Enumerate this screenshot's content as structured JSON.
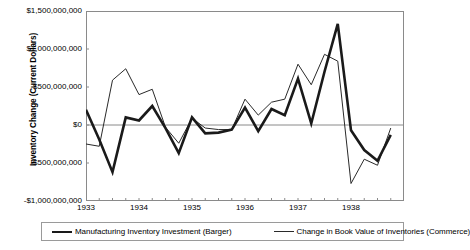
{
  "chart_data": {
    "type": "line",
    "title": "",
    "xlabel": "",
    "ylabel": "Inventory Change (Current Dollars)",
    "ylim": [
      -1000000000,
      1500000000
    ],
    "ytick_values": [
      1500000000,
      1000000000,
      500000000,
      0,
      -500000000,
      -1000000000
    ],
    "ytick_labels": [
      "$1,500,000,000",
      "$1,000,000,000",
      "$500,000,000",
      "$0",
      "-$500,000,000",
      "-$1,000,000,000"
    ],
    "xtick_labels": [
      "1933",
      "1934",
      "1935",
      "1936",
      "1937",
      "1938"
    ],
    "x_period": "quarterly",
    "x": [
      "1933Q1",
      "1933Q2",
      "1933Q3",
      "1933Q4",
      "1934Q1",
      "1934Q2",
      "1934Q3",
      "1934Q4",
      "1935Q1",
      "1935Q2",
      "1935Q3",
      "1935Q4",
      "1936Q1",
      "1936Q2",
      "1936Q3",
      "1936Q4",
      "1937Q1",
      "1937Q2",
      "1937Q3",
      "1937Q4",
      "1938Q1",
      "1938Q2",
      "1938Q3",
      "1938Q4"
    ],
    "grid": false,
    "legend_position": "bottom",
    "zero_line": true,
    "series": [
      {
        "name": "Manufacturing Inventory Investment (Barger)",
        "style": "thick",
        "color": "#1a1a1a",
        "values": [
          200000000,
          -190000000,
          -620000000,
          100000000,
          60000000,
          250000000,
          -40000000,
          -370000000,
          100000000,
          -110000000,
          -100000000,
          -60000000,
          230000000,
          -80000000,
          210000000,
          130000000,
          610000000,
          20000000,
          700000000,
          1330000000,
          -70000000,
          -330000000,
          -470000000,
          -130000000
        ]
      },
      {
        "name": "Change in Book Value of Inventories (Commerce)",
        "style": "thin",
        "color": "#2a2a2a",
        "values": [
          -250000000,
          -280000000,
          590000000,
          740000000,
          400000000,
          470000000,
          -30000000,
          -240000000,
          90000000,
          -40000000,
          -60000000,
          -60000000,
          340000000,
          130000000,
          300000000,
          340000000,
          800000000,
          530000000,
          930000000,
          840000000,
          -770000000,
          -450000000,
          -530000000,
          -40000000
        ]
      }
    ]
  },
  "legend": {
    "entries": [
      {
        "label": "Manufacturing Inventory Investment (Barger)"
      },
      {
        "label": "Change in Book Value of Inventories (Commerce)"
      }
    ]
  },
  "caption_sliver": ""
}
